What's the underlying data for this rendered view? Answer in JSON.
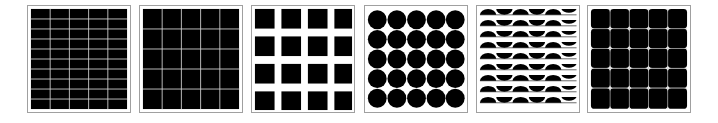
{
  "figure": {
    "background_color": "#ffffff",
    "frame_color": "#a0a0a0",
    "fill_color": "#000000",
    "panels": [
      {
        "id": "p1",
        "pattern": "grid-fine",
        "cols": 5,
        "rows": 10,
        "gap_color": "#cfcfcf",
        "left": 27
      },
      {
        "id": "p2",
        "pattern": "grid-coarse",
        "cols": 5,
        "rows": 5,
        "gap_color": "#cfcfcf",
        "left": 139
      },
      {
        "id": "p3",
        "pattern": "separated-squares",
        "cols": 4,
        "rows": 4,
        "left": 251
      },
      {
        "id": "p4",
        "pattern": "circles",
        "cols": 5,
        "rows": 5,
        "left": 364
      },
      {
        "id": "p5",
        "pattern": "alternating-half-discs",
        "cols": 6,
        "rows": 9,
        "left": 476
      },
      {
        "id": "p6",
        "pattern": "rounded-squares-with-dots",
        "cols": 5,
        "rows": 5,
        "left": 587
      }
    ]
  }
}
